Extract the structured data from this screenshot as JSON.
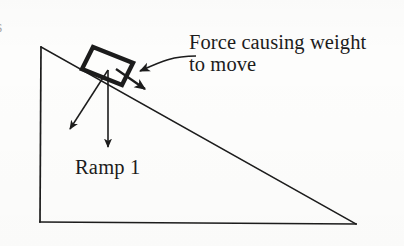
{
  "figure": {
    "type": "physics-free-body-diagram",
    "background_color": "#fdfdfc",
    "ink_color": "#1c1c1c"
  },
  "labels": {
    "force_label_line1": "Force causing weight",
    "force_label_line2": "to move",
    "ramp_label": "Ramp 1",
    "edge_fragment": "s"
  },
  "geometry": {
    "triangle": {
      "apex": [
        41,
        47
      ],
      "bottom_left": [
        40,
        222
      ],
      "bottom_right": [
        356,
        224
      ],
      "stroke_width": 1.6
    },
    "block": {
      "corners": [
        [
          93,
          47
        ],
        [
          133,
          63
        ],
        [
          122,
          85
        ],
        [
          82,
          69
        ]
      ],
      "stroke_width": 4.2
    },
    "vectors": [
      {
        "name": "normal-force-arrow",
        "from": [
          108,
          70
        ],
        "to": [
          68,
          132
        ],
        "stroke_width": 1.5
      },
      {
        "name": "weight-arrow",
        "from": [
          108,
          70
        ],
        "to": [
          108,
          151
        ],
        "stroke_width": 1.5
      },
      {
        "name": "driving-force-arrow",
        "from": [
          115,
          68
        ],
        "to": [
          149,
          92
        ],
        "stroke_width": 2.2
      }
    ],
    "leader": {
      "name": "force-label-leader",
      "start": [
        192,
        57
      ],
      "control1": [
        168,
        58
      ],
      "control2": [
        158,
        64
      ],
      "end": [
        136,
        72
      ],
      "stroke_width": 1.6
    }
  },
  "colors": {
    "ink": "#1c1c1c",
    "paper": "#fdfdfc",
    "faint": "#8d8d8d"
  }
}
